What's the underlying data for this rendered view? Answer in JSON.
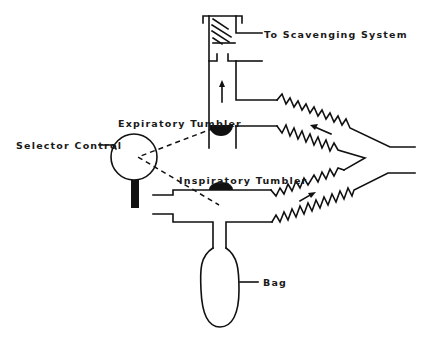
{
  "diagram": {
    "type": "anesthesia breathing system schematic",
    "labels": {
      "scavenging": "To Scavenging System",
      "expiratory_tumbler": "Expiratory Tumbler",
      "selector_control": "Selector Control",
      "inspiratory_tumbler": "Inspiratory Tumbler",
      "bag": "Bag"
    },
    "components": [
      {
        "id": "scavenging-canister",
        "label_ref": "scavenging"
      },
      {
        "id": "expiratory-limb",
        "flow_direction": "up / toward scavenging"
      },
      {
        "id": "expiratory-tumbler",
        "label_ref": "expiratory_tumbler"
      },
      {
        "id": "selector-control",
        "label_ref": "selector_control"
      },
      {
        "id": "inspiratory-tumbler",
        "label_ref": "inspiratory_tumbler"
      },
      {
        "id": "inspiratory-limb",
        "flow_direction": "toward patient"
      },
      {
        "id": "reservoir-bag",
        "label_ref": "bag"
      },
      {
        "id": "corrugated-hoses",
        "count": 4
      },
      {
        "id": "y-piece"
      }
    ],
    "colors": {
      "line": "#111111",
      "background": "#ffffff",
      "text": "#1a1a1a"
    }
  }
}
